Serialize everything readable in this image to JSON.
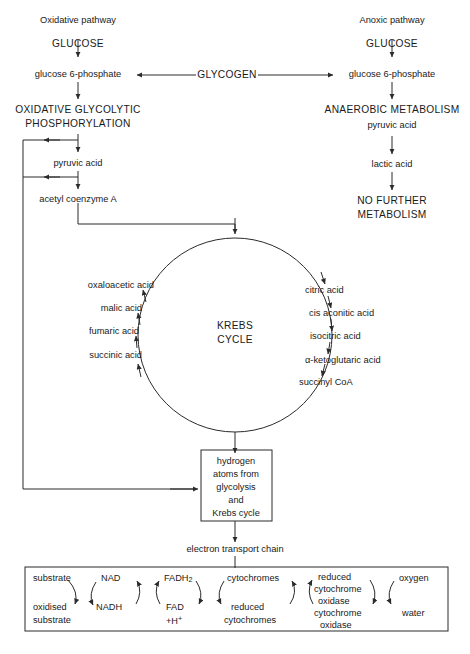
{
  "diagram": {
    "stroke_color": "#2b2b2b",
    "text_color": "#1a1a1a",
    "background": "#ffffff"
  },
  "left_pathway": {
    "heading": "Oxidative pathway",
    "steps": [
      "GLUCOSE",
      "glucose 6-phosphate",
      "OXIDATIVE GLYCOLYTIC",
      "PHOSPHORYLATION",
      "pyruvic acid",
      "acetyl coenzyme A"
    ],
    "glucose": "GLUCOSE",
    "glucose_6_phosphate": "glucose 6-phosphate",
    "oxidative_line1": "OXIDATIVE GLYCOLYTIC",
    "oxidative_line2": "PHOSPHORYLATION",
    "pyruvic_acid": "pyruvic acid",
    "acetyl_coenzyme_a": "acetyl coenzyme A"
  },
  "center": {
    "glycogen": "GLYCOGEN"
  },
  "right_pathway": {
    "heading": "Anoxic pathway",
    "glucose": "GLUCOSE",
    "glucose_6_phosphate": "glucose 6-phosphate",
    "anaerobic_metabolism": "ANAEROBIC METABOLISM",
    "pyruvic_acid": "pyruvic acid",
    "lactic_acid": "lactic acid",
    "no_further_line1": "NO FURTHER",
    "no_further_line2": "METABOLISM"
  },
  "krebs": {
    "title_line1": "KREBS",
    "title_line2": "CYCLE",
    "left_column": [
      "oxaloacetic acid",
      "malic acid",
      "fumaric acid",
      "succinic acid"
    ],
    "right_column": [
      "citric acid",
      "cis aconitic acid",
      "isocitric acid",
      "α-ketoglutaric acid",
      "succinyl CoA"
    ]
  },
  "hydrogen_box": {
    "lines": [
      "hydrogen",
      "atoms from",
      "glycolysis",
      "and",
      "Krebs cycle"
    ]
  },
  "electron_transport": {
    "label": "electron transport chain",
    "pairs": [
      {
        "top": "substrate",
        "bottom_line1": "oxidised",
        "bottom_line2": "substrate"
      },
      {
        "top": "NAD",
        "bottom_line1": "NADH",
        "bottom_line2": ""
      },
      {
        "top": "FADH2",
        "bottom_line1": "FAD",
        "bottom_line2": "+H+"
      },
      {
        "top": "cytochromes",
        "bottom_line1": "reduced",
        "bottom_line2": "cytochromes"
      },
      {
        "top_line1": "reduced",
        "top_line2": "cytochrome",
        "top_line3": "oxidase",
        "bottom_line1": "cytochrome",
        "bottom_line2": "oxidase"
      },
      {
        "top": "oxygen",
        "bottom_line1": "water",
        "bottom_line2": ""
      }
    ],
    "substrate": "substrate",
    "oxidised": "oxidised",
    "substrate2": "substrate",
    "nad": "NAD",
    "nadh": "NADH",
    "fadh2_base": "FADH",
    "fadh2_sub": "2",
    "fad": "FAD",
    "fad_h": "+H",
    "fad_h_sup": "+",
    "cytochromes": "cytochromes",
    "reduced": "reduced",
    "reduced_cytochromes": "cytochromes",
    "red_cyt_ox_1": "reduced",
    "red_cyt_ox_2": "cytochrome",
    "red_cyt_ox_3": "oxidase",
    "cyt_ox_1": "cytochrome",
    "cyt_ox_2": "oxidase",
    "oxygen": "oxygen",
    "water": "water"
  }
}
